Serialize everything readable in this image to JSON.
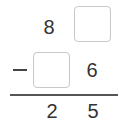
{
  "problem": {
    "operation": "subtraction",
    "operator_symbol": "−",
    "row1": {
      "tens": "8",
      "ones": ""
    },
    "row2": {
      "tens": "",
      "ones": "6"
    },
    "result": {
      "tens": "2",
      "ones": "5"
    },
    "blanks": [
      "row1.ones",
      "row2.tens"
    ]
  }
}
